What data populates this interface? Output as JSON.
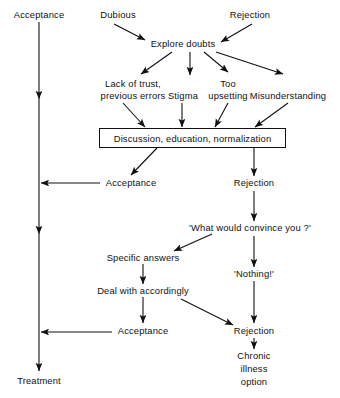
{
  "diagram": {
    "stroke_color": "#111111",
    "background_color": "#ffffff",
    "nodes": {
      "acceptance_top": "Acceptance",
      "dubious": "Dubious",
      "rejection_top": "Rejection",
      "explore_doubts": "Explore doubts",
      "lack_of_trust_line1": "Lack of trust,",
      "lack_of_trust_line2": "previous errors",
      "stigma": "Stigma",
      "too_line1": "Too",
      "too_line2": "upsetting",
      "misunderstanding": "Misunderstanding",
      "discussion_box": "Discussion, education, normalization",
      "acceptance_mid": "Acceptance",
      "rejection_mid": "Rejection",
      "what_would_convince": "'What would convince you ?'",
      "specific_answers": "Specific answers",
      "nothing": "'Nothing!'",
      "deal_with_accordingly": "Deal with accordingly",
      "acceptance_low": "Acceptance",
      "rejection_low": "Rejection",
      "chronic_line1": "Chronic",
      "chronic_line2": "illness",
      "chronic_line3": "option",
      "treatment": "Treatment"
    }
  }
}
